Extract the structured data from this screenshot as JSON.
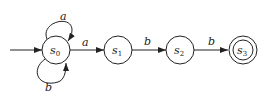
{
  "diagram": {
    "type": "finite-automaton",
    "states": [
      {
        "id": "s0",
        "label": "s",
        "sub": "0",
        "initial": true,
        "accepting": false
      },
      {
        "id": "s1",
        "label": "s",
        "sub": "1",
        "initial": false,
        "accepting": false
      },
      {
        "id": "s2",
        "label": "s",
        "sub": "2",
        "initial": false,
        "accepting": false
      },
      {
        "id": "s3",
        "label": "s",
        "sub": "3",
        "initial": false,
        "accepting": true
      }
    ],
    "transitions": [
      {
        "from": "s0",
        "to": "s0",
        "label": "a"
      },
      {
        "from": "s0",
        "to": "s0",
        "label": "b"
      },
      {
        "from": "s0",
        "to": "s1",
        "label": "a"
      },
      {
        "from": "s1",
        "to": "s2",
        "label": "b"
      },
      {
        "from": "s2",
        "to": "s3",
        "label": "b"
      }
    ]
  }
}
